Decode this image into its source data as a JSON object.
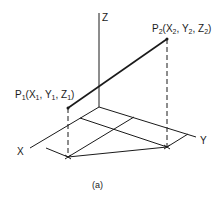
{
  "diagram": {
    "axes": {
      "x_label": "X",
      "y_label": "Y",
      "z_label": "Z"
    },
    "points": [
      {
        "name": "P1",
        "label_main": "P",
        "sub": "1",
        "coords": [
          "X",
          "1",
          "Y",
          "1",
          "Z",
          "1"
        ]
      },
      {
        "name": "P2",
        "label_main": "P",
        "sub": "2",
        "coords": [
          "X",
          "2",
          "Y",
          "2",
          "Z",
          "2"
        ]
      }
    ],
    "caption": "(a)",
    "line_color": "#1a1a1a"
  }
}
